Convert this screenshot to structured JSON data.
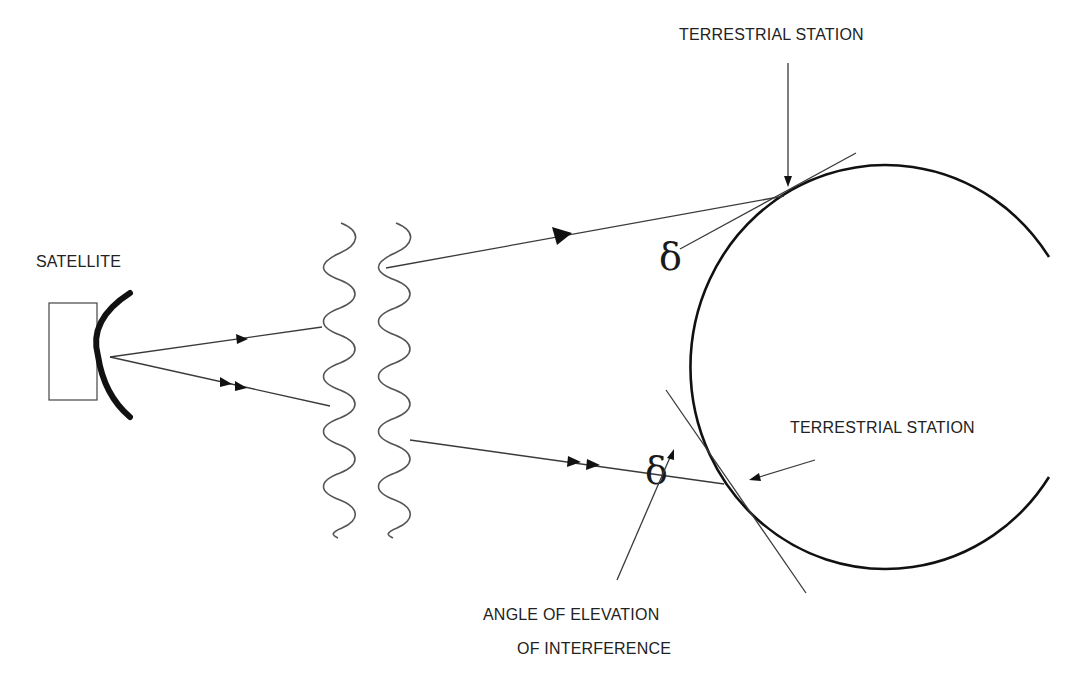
{
  "diagram": {
    "labels": {
      "satellite": "SATELLITE",
      "station_top": "TERRESTRIAL STATION",
      "station_bottom": "TERRESTRIAL STATION",
      "elevation_line1": "ANGLE OF ELEVATION",
      "elevation_line2": "OF INTERFERENCE"
    },
    "symbols": {
      "angle_top": "δ",
      "angle_bottom": "δ"
    },
    "colors": {
      "background": "#ffffff",
      "line": "#3a3a3a",
      "earth": "#111111",
      "text": "#222222"
    }
  }
}
